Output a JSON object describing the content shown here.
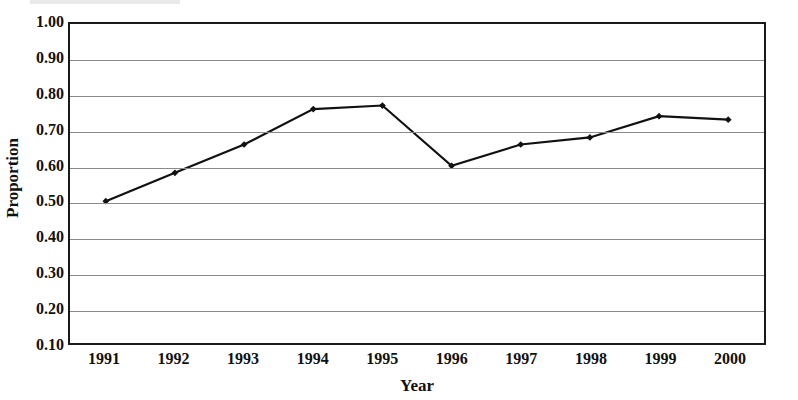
{
  "chart_data": {
    "type": "line",
    "title": "",
    "xlabel": "Year",
    "ylabel": "Proportion",
    "categories": [
      "1991",
      "1992",
      "1993",
      "1994",
      "1995",
      "1996",
      "1997",
      "1998",
      "1999",
      "2000"
    ],
    "x": [
      1991,
      1992,
      1993,
      1994,
      1995,
      1996,
      1997,
      1998,
      1999,
      2000
    ],
    "values": [
      0.5,
      0.58,
      0.66,
      0.76,
      0.77,
      0.6,
      0.66,
      0.68,
      0.74,
      0.73
    ],
    "series": [
      {
        "name": "Proportion",
        "values": [
          0.5,
          0.58,
          0.66,
          0.76,
          0.77,
          0.6,
          0.66,
          0.68,
          0.74,
          0.73
        ]
      }
    ],
    "ylim": [
      0.1,
      1.0
    ],
    "yticks": [
      "1.00",
      "0.90",
      "0.80",
      "0.70",
      "0.60",
      "0.50",
      "0.40",
      "0.30",
      "0.20",
      "0.10"
    ],
    "ytick_values": [
      1.0,
      0.9,
      0.8,
      0.7,
      0.6,
      0.5,
      0.4,
      0.3,
      0.2,
      0.1
    ],
    "grid": true,
    "legend": "none",
    "line_color": "#111111",
    "marker": "diamond",
    "marker_color": "#111111"
  }
}
